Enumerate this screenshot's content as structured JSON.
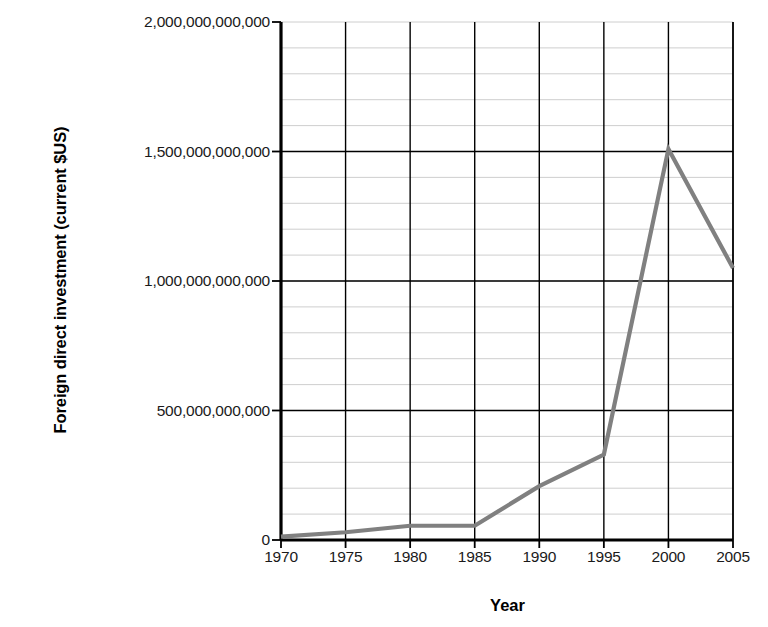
{
  "chart_data": {
    "type": "line",
    "title": "",
    "xlabel": "Year",
    "ylabel": "Foreign direct investment (current $US)",
    "x": [
      1970,
      1975,
      1980,
      1985,
      1990,
      1995,
      2000,
      2005
    ],
    "categories": [
      "1970",
      "1975",
      "1980",
      "1985",
      "1990",
      "1995",
      "2000",
      "2005"
    ],
    "values": [
      13000000000,
      30000000000,
      55000000000,
      55000000000,
      208000000000,
      330000000000,
      1510000000000,
      1050000000000
    ],
    "series": [
      {
        "name": "Foreign direct investment",
        "values": [
          13000000000,
          30000000000,
          55000000000,
          55000000000,
          208000000000,
          330000000000,
          1510000000000,
          1050000000000
        ]
      }
    ],
    "xlim": [
      1970,
      2005
    ],
    "ylim": [
      0,
      2000000000000
    ],
    "xtick_labels": [
      "1970",
      "1975",
      "1980",
      "1985",
      "1990",
      "1995",
      "2000",
      "2005"
    ],
    "ytick_values": [
      0,
      500000000000,
      1000000000000,
      1500000000000,
      2000000000000
    ],
    "ytick_labels": [
      "0",
      "500,000,000,000",
      "1,000,000,000,000",
      "1,500,000,000,000",
      "2,000,000,000,000"
    ],
    "minor_ytick_step": 100000000000,
    "grid": "major-and-minor",
    "legend": "none",
    "line_color": "#808080",
    "axis_color": "#000000",
    "major_grid_color": "#000000",
    "minor_grid_color": "#c8c8c8",
    "background_color": "#ffffff"
  }
}
